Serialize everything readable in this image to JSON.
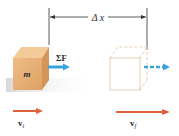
{
  "diagram": {
    "displacement_label": "Δ x",
    "mass_label": "m",
    "force_label": "ΣF",
    "initial_velocity_label": "v",
    "initial_velocity_subscript": "i",
    "final_velocity_label": "v",
    "final_velocity_subscript": "f",
    "colors": {
      "block_front": "#e8b37a",
      "block_top": "#f1c894",
      "block_side": "#d89a5a",
      "ghost_outline": "#e2c2a2",
      "force_arrow": "#3aa3dc",
      "velocity_arrow": "#e0603a",
      "dimension_line": "#333333"
    }
  }
}
